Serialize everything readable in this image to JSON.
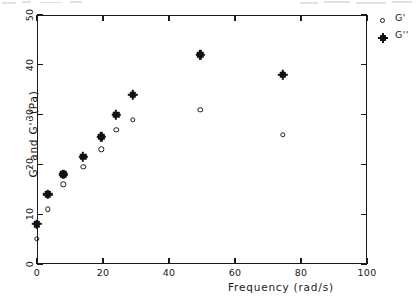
{
  "chart_data": {
    "type": "scatter",
    "title": "",
    "xlabel": "Frequency (rad/s)",
    "ylabel": "G' and G'' (Pa)",
    "xlim": [
      0,
      100
    ],
    "ylim": [
      0,
      50
    ],
    "xticks": [
      "0",
      "20",
      "40",
      "60",
      "80",
      "100"
    ],
    "xtick_values": [
      0,
      20,
      40,
      60,
      80,
      100
    ],
    "yticks": [
      "0",
      "10",
      "20",
      "30",
      "40",
      "50"
    ],
    "ytick_values": [
      0,
      10,
      20,
      30,
      40,
      50
    ],
    "grid": false,
    "legend_position": "right-outside",
    "series": [
      {
        "name": "G'",
        "marker": "open-circle",
        "color": "#1a1a1a",
        "x": [
          0,
          3.3,
          8.0,
          14.0,
          19.5,
          24.0,
          29.0,
          49.5,
          74.5
        ],
        "values": [
          5.0,
          11.0,
          16.0,
          19.5,
          23.0,
          27.0,
          29.0,
          31.0,
          26.0
        ]
      },
      {
        "name": "G''",
        "marker": "filled-star",
        "color": "#121212",
        "x": [
          0,
          3.3,
          8.0,
          14.0,
          19.5,
          24.0,
          29.0,
          49.5,
          74.5
        ],
        "values": [
          8.0,
          14.0,
          18.0,
          21.5,
          25.5,
          30.0,
          34.0,
          42.0,
          38.0
        ]
      }
    ]
  },
  "legend": {
    "entries": [
      {
        "label": "G'",
        "marker": "open-circle"
      },
      {
        "label": "G''",
        "marker": "filled-star"
      }
    ]
  },
  "axes": {
    "x_title": "Frequency (rad/s)",
    "y_title": "G' and G'' (Pa)"
  }
}
